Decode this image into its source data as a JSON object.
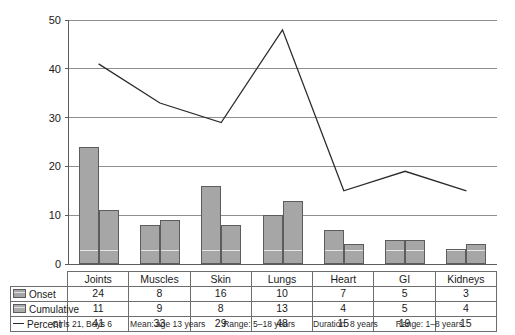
{
  "chart_data": {
    "type": "bar",
    "title": "",
    "xlabel": "",
    "ylabel": "",
    "ylim": [
      0,
      50
    ],
    "yticks": [
      0,
      10,
      20,
      30,
      40,
      50
    ],
    "grid": true,
    "legend_position": "table-row-labels",
    "categories": [
      "Joints",
      "Muscles",
      "Skin",
      "Lungs",
      "Heart",
      "GI",
      "Kidneys"
    ],
    "series": [
      {
        "name": "Onset",
        "type": "bar",
        "values": [
          24,
          8,
          16,
          10,
          7,
          5,
          3
        ]
      },
      {
        "name": "Cumulative",
        "type": "bar",
        "values": [
          11,
          9,
          8,
          13,
          4,
          5,
          4
        ]
      },
      {
        "name": "Percent",
        "type": "line",
        "values": [
          41,
          33,
          29,
          48,
          15,
          19,
          15
        ]
      }
    ]
  },
  "axis": {
    "yticks": [
      "50",
      "40",
      "30",
      "20",
      "10",
      "0"
    ]
  },
  "table": {
    "header": [
      "Joints",
      "Muscles",
      "Skin",
      "Lungs",
      "Heart",
      "GI",
      "Kidneys"
    ],
    "rows": [
      {
        "label": "Onset",
        "marker": "bar-swatch-onset",
        "values": [
          "24",
          "8",
          "16",
          "10",
          "7",
          "5",
          "3"
        ]
      },
      {
        "label": "Cumulative",
        "marker": "bar-swatch-cumulative",
        "values": [
          "11",
          "9",
          "8",
          "13",
          "4",
          "5",
          "4"
        ]
      },
      {
        "label": "Percent",
        "marker": "line-dash-percent",
        "values": [
          "41",
          "33",
          "29",
          "48",
          "15",
          "19",
          "15"
        ]
      }
    ]
  },
  "footer": {
    "items": [
      "Girls 21, Boys 6",
      "Mean: age 13 years",
      "Range: 5–18 years",
      "Duration: 8 years",
      "Range: 1–8 years"
    ]
  },
  "colors": {
    "bar_fill": "#a6a6a6",
    "bar_stroke": "#5c5c5c",
    "line": "#2b2b2b",
    "grid": "#8f8f8f",
    "axis": "#5c5c5c",
    "text": "#1a1a1a"
  }
}
